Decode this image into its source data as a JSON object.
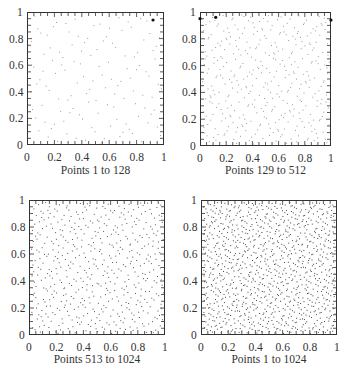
{
  "chart_data": [
    {
      "type": "scatter",
      "title": "Points 1 to 128",
      "point_range": [
        1,
        128
      ],
      "xlim": [
        0,
        1
      ],
      "ylim": [
        0,
        1
      ],
      "xticks": [
        "0",
        "0.2",
        "0.4",
        "0.6",
        "0.8",
        "1"
      ],
      "yticks": [
        "0",
        "0.2",
        "0.4",
        "0.6",
        "0.8",
        "1"
      ],
      "grid": false,
      "sequence": "low-discrepancy (quasi-random) 2D points",
      "highlighted_points": [
        [
          0.92,
          0.94
        ]
      ]
    },
    {
      "type": "scatter",
      "title": "Points 129 to 512",
      "point_range": [
        129,
        512
      ],
      "xlim": [
        0,
        1
      ],
      "ylim": [
        0,
        1
      ],
      "xticks": [
        "0",
        "0.2",
        "0.4",
        "0.6",
        "0.8",
        "1"
      ],
      "yticks": [
        "0",
        "0.2",
        "0.4",
        "0.6",
        "0.8",
        "1"
      ],
      "grid": false,
      "sequence": "low-discrepancy (quasi-random) 2D points",
      "highlighted_points": [
        [
          0.0,
          0.95
        ],
        [
          0.12,
          0.96
        ],
        [
          1.0,
          0.94
        ]
      ]
    },
    {
      "type": "scatter",
      "title": "Points 513 to 1024",
      "point_range": [
        513,
        1024
      ],
      "xlim": [
        0,
        1
      ],
      "ylim": [
        0,
        1
      ],
      "xticks": [
        "0",
        "0.2",
        "0.4",
        "0.6",
        "0.8",
        "1"
      ],
      "yticks": [
        "0",
        "0.2",
        "0.4",
        "0.6",
        "0.8",
        "1"
      ],
      "grid": false,
      "sequence": "low-discrepancy (quasi-random) 2D points"
    },
    {
      "type": "scatter",
      "title": "Points 1 to 1024",
      "point_range": [
        1,
        1024
      ],
      "xlim": [
        0,
        1
      ],
      "ylim": [
        0,
        1
      ],
      "xticks": [
        "0",
        "0.2",
        "0.4",
        "0.6",
        "0.8",
        "1"
      ],
      "yticks": [
        "0",
        "0.2",
        "0.4",
        "0.6",
        "0.8",
        "1"
      ],
      "grid": false,
      "sequence": "low-discrepancy (quasi-random) 2D points"
    }
  ],
  "panels": [
    {
      "caption": "Points 1 to 128",
      "frame": {
        "x": 27,
        "y": 12,
        "w": 137,
        "h": 133
      },
      "start": 1,
      "end": 128,
      "dot_color": "#9a9a9a"
    },
    {
      "caption": "Points 129 to 512",
      "frame": {
        "x": 200,
        "y": 12,
        "w": 131,
        "h": 134
      },
      "start": 129,
      "end": 512,
      "dot_color": "#9a9a9a"
    },
    {
      "caption": "Points 513 to 1024",
      "frame": {
        "x": 29,
        "y": 200,
        "w": 136,
        "h": 135
      },
      "start": 513,
      "end": 1024,
      "dot_color": "#555555"
    },
    {
      "caption": "Points 1 to 1024",
      "frame": {
        "x": 201,
        "y": 200,
        "w": 136,
        "h": 135
      },
      "start": 1,
      "end": 1024,
      "dot_color": "#444444"
    }
  ],
  "tick_labels": [
    "0",
    "0.2",
    "0.4",
    "0.6",
    "0.8",
    "1"
  ],
  "colors": {
    "frame": "#333333",
    "text": "#333333",
    "background": "#ffffff"
  }
}
